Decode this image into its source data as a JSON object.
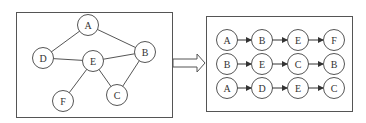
{
  "colors": {
    "stroke": "#555555",
    "text": "#333333",
    "background": "#ffffff"
  },
  "left_panel": {
    "title": "graph",
    "nodes": [
      {
        "id": "A",
        "label": "A",
        "x": 88,
        "y": 25
      },
      {
        "id": "B",
        "label": "B",
        "x": 145,
        "y": 52
      },
      {
        "id": "D",
        "label": "D",
        "x": 43,
        "y": 58
      },
      {
        "id": "E",
        "label": "E",
        "x": 93,
        "y": 61
      },
      {
        "id": "C",
        "label": "C",
        "x": 117,
        "y": 95
      },
      {
        "id": "F",
        "label": "F",
        "x": 63,
        "y": 101
      }
    ],
    "edges": [
      [
        "A",
        "D"
      ],
      [
        "A",
        "B"
      ],
      [
        "D",
        "E"
      ],
      [
        "E",
        "B"
      ],
      [
        "E",
        "C"
      ],
      [
        "E",
        "F"
      ],
      [
        "B",
        "C"
      ]
    ]
  },
  "arrow": {
    "label": "transform-arrow"
  },
  "right_panel": {
    "title": "walk-sequences",
    "sequences": [
      [
        "A",
        "B",
        "E",
        "F"
      ],
      [
        "B",
        "E",
        "C",
        "B"
      ],
      [
        "A",
        "D",
        "E",
        "C"
      ]
    ]
  }
}
